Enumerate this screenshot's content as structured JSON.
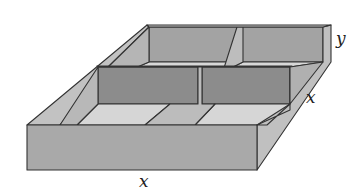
{
  "figure": {
    "labels": {
      "height": "y",
      "depth": "x",
      "width": "x"
    },
    "colors": {
      "outer_face": "#a8a8a8",
      "top_rim": "#c4c4c4",
      "inner_wall_dark": "#8e8e8e",
      "floor": "#d6d6d6",
      "edge": "#333333"
    }
  }
}
